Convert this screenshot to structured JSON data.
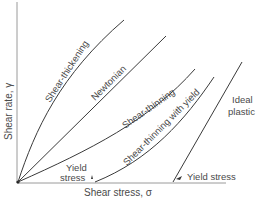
{
  "axes": {
    "y_label": "Shear rate, γ",
    "x_label": "Shear stress, σ"
  },
  "curves": [
    {
      "id": "shear-thickening",
      "label": "Shear-thickening"
    },
    {
      "id": "newtonian",
      "label": "Newtonian"
    },
    {
      "id": "shear-thinning",
      "label": "Shear-thinning"
    },
    {
      "id": "shear-thinning-with-yield",
      "label": "Shear-thinning with yield"
    },
    {
      "id": "ideal-plastic",
      "label_line1": "Ideal",
      "label_line2": "plastic"
    }
  ],
  "annotations": {
    "yield_stress_left_line1": "Yield",
    "yield_stress_left_line2": "stress",
    "yield_stress_right": "Yield stress"
  },
  "colors": {
    "line": "#3a3a3a",
    "axis": "#9a9a9a",
    "text": "#4a4a4a"
  }
}
